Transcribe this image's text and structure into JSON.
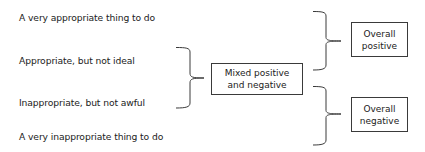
{
  "diagram": {
    "categories": [
      {
        "id": "very-appropriate",
        "label": "A very appropriate thing to do"
      },
      {
        "id": "appropriate-not-ideal",
        "label": "Appropriate, but not ideal"
      },
      {
        "id": "inappropriate-not-awful",
        "label": "Inappropriate, but not awful"
      },
      {
        "id": "very-inappropriate",
        "label": "A very inappropriate thing to do"
      }
    ],
    "groups": {
      "mixed": {
        "line1": "Mixed positive",
        "line2": "and negative",
        "covers": [
          "appropriate-not-ideal",
          "inappropriate-not-awful"
        ]
      },
      "positive": {
        "line1": "Overall",
        "line2": "positive",
        "covers": [
          "very-appropriate",
          "appropriate-not-ideal"
        ]
      },
      "negative": {
        "line1": "Overall",
        "line2": "negative",
        "covers": [
          "inappropriate-not-awful",
          "very-inappropriate"
        ]
      }
    },
    "colors": {
      "text": "#222222",
      "stroke": "#3a3a3a",
      "background": "#ffffff"
    }
  }
}
